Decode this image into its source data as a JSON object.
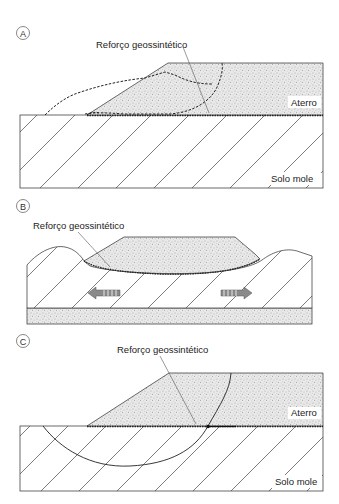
{
  "figure": {
    "panels": [
      {
        "id": "A",
        "circle_label": "A",
        "reinforcement_label": "Reforço geossintético",
        "fill_label": "Aterro",
        "soil_label": "Solo mole",
        "description": "Embankment on soft soil with reinforcement at base; dashed lines show potential failure surfaces (slope spreading and rotational)"
      },
      {
        "id": "B",
        "circle_label": "B",
        "reinforcement_label": "Reforço geossintético",
        "description": "Embankment settling into soft soil; arrows show lateral spreading of foundation soil"
      },
      {
        "id": "C",
        "circle_label": "C",
        "reinforcement_label": "Reforço geossintético",
        "fill_label": "Aterro",
        "soil_label": "Solo mole",
        "description": "Circular rotational failure surface through embankment and soft soil, crossing the reinforcement"
      }
    ],
    "colors": {
      "line": "#333333",
      "arrow": "#8a8a8a",
      "background": "#ffffff"
    }
  }
}
